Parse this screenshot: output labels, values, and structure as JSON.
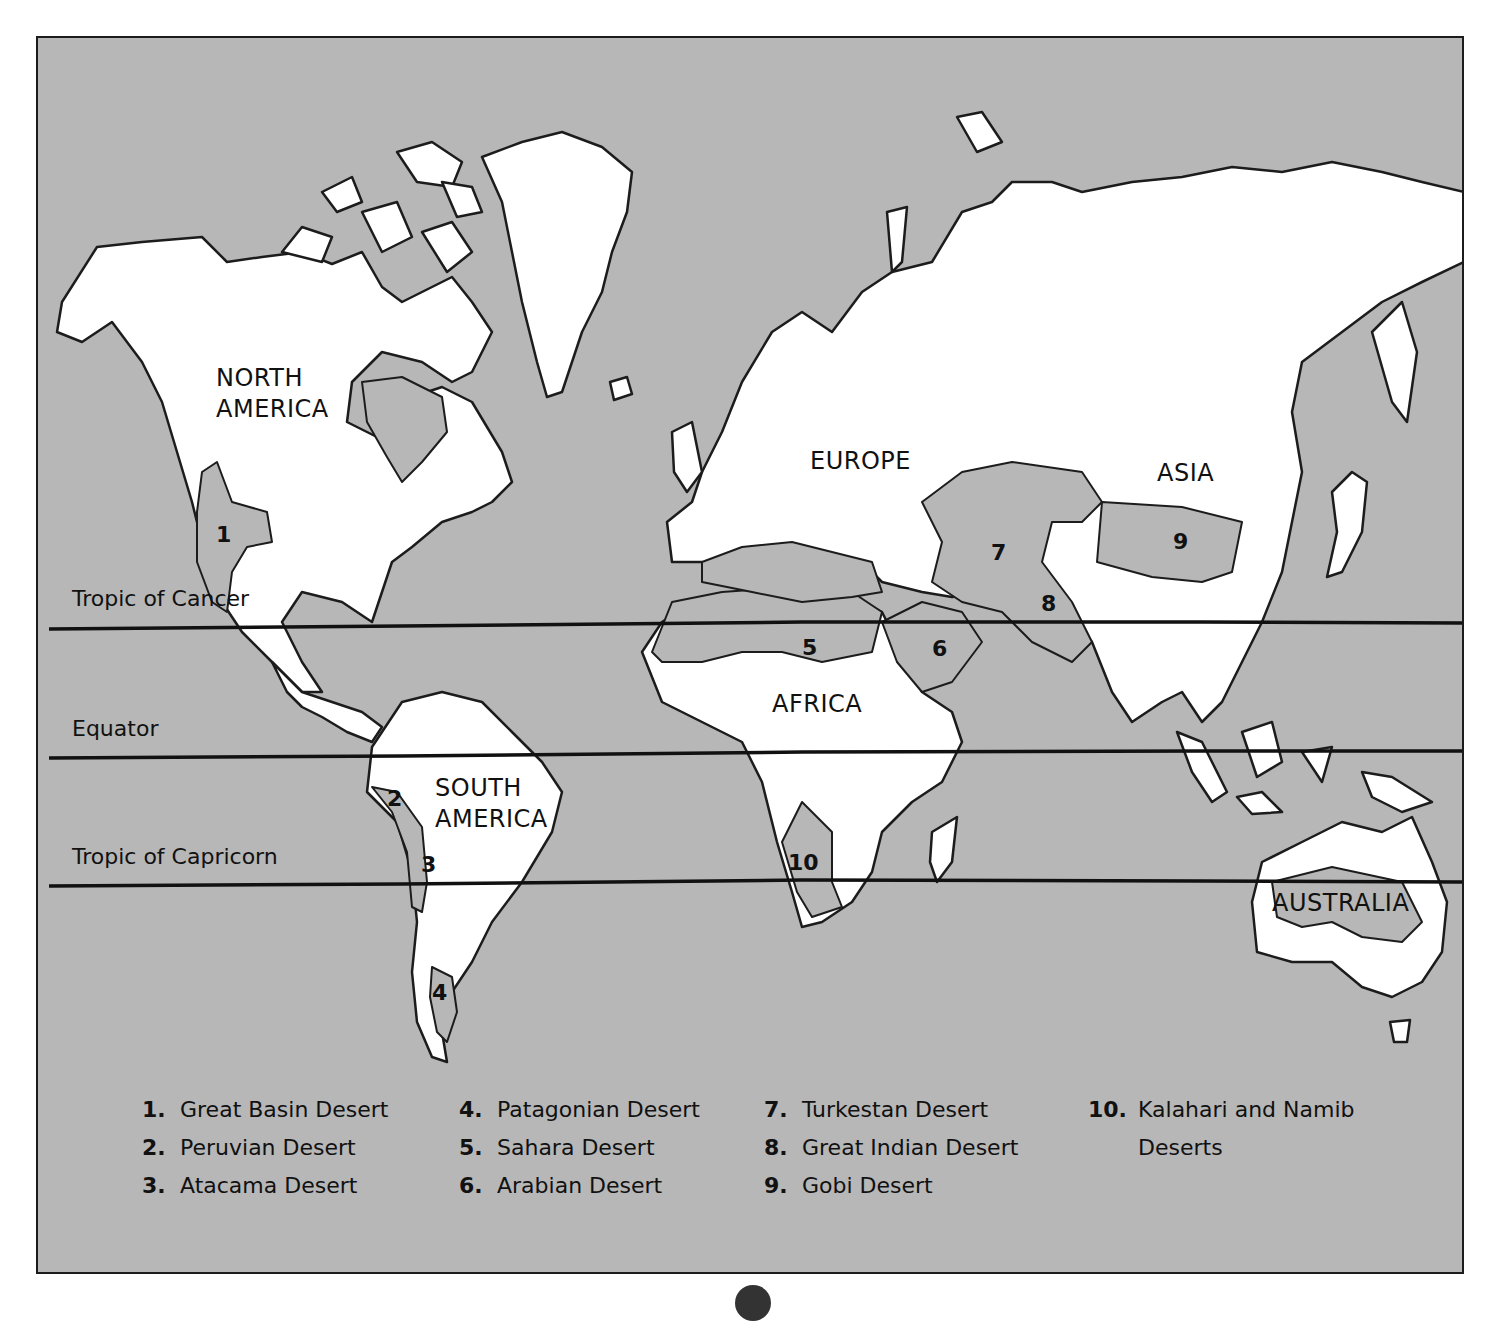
{
  "map": {
    "continents": [
      {
        "name": "NORTH AMERICA",
        "line1": "NORTH",
        "line2": "AMERICA"
      },
      {
        "name": "SOUTH AMERICA",
        "line1": "SOUTH",
        "line2": "AMERICA"
      },
      {
        "name": "EUROPE"
      },
      {
        "name": "ASIA"
      },
      {
        "name": "AFRICA"
      },
      {
        "name": "AUSTRALIA"
      }
    ],
    "latitude_lines": [
      {
        "label": "Tropic of Cancer"
      },
      {
        "label": "Equator"
      },
      {
        "label": "Tropic of Capricorn"
      }
    ],
    "desert_markers": [
      "1",
      "2",
      "3",
      "4",
      "5",
      "6",
      "7",
      "8",
      "9",
      "10"
    ],
    "colors": {
      "ocean": "#b7b7b7",
      "land": "#ffffff",
      "desert": "#b7b7b7",
      "outline": "#1c1c1c"
    }
  },
  "legend": [
    {
      "number": "1.",
      "name": "Great Basin Desert"
    },
    {
      "number": "2.",
      "name": "Peruvian Desert"
    },
    {
      "number": "3.",
      "name": "Atacama Desert"
    },
    {
      "number": "4.",
      "name": "Patagonian Desert"
    },
    {
      "number": "5.",
      "name": "Sahara Desert"
    },
    {
      "number": "6.",
      "name": "Arabian Desert"
    },
    {
      "number": "7.",
      "name": "Turkestan Desert"
    },
    {
      "number": "8.",
      "name": "Great Indian Desert"
    },
    {
      "number": "9.",
      "name": "Gobi Desert"
    },
    {
      "number": "10.",
      "name": "Kalahari and Namib",
      "name_line2": "Deserts"
    }
  ]
}
